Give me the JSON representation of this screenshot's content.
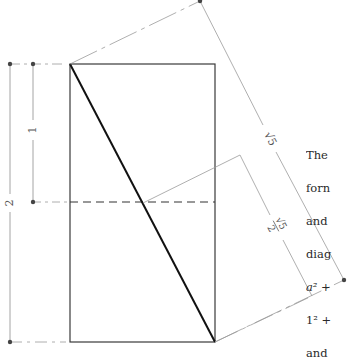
{
  "diagram": {
    "rectangle": {
      "width_units": 1,
      "height_units": 2
    },
    "labels": {
      "side_half": "1",
      "side_full": "2",
      "diagonal_full": "√5",
      "diagonal_half_num": "√5",
      "diagonal_half_den": "2"
    },
    "colors": {
      "rect_stroke": "#3a3a3a",
      "diagonal": "#111111",
      "dimension_lines": "#9a9a9a",
      "dots": "#444444",
      "text": "#2a2a2a"
    }
  },
  "caption": {
    "lines": [
      "The",
      "forn",
      "and",
      "diag",
      "a² +",
      "1² +",
      "and"
    ]
  }
}
